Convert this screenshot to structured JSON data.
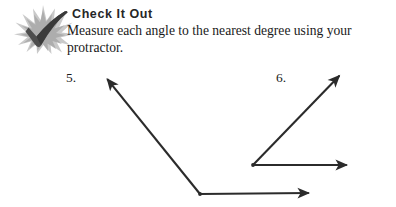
{
  "page": {
    "width": 396,
    "height": 207,
    "background": "#ffffff"
  },
  "callout": {
    "icon_name": "starburst-check-icon",
    "heading": "Check It Out",
    "body_lines": [
      "Measure each angle to the nearest degree using your",
      "protractor."
    ],
    "body_text": "Measure each angle to the nearest degree using your protractor.",
    "heading_color": "#262626",
    "body_color": "#1a1a1a",
    "burst_color": "#b5b5b5",
    "check_color": "#4a4a4a"
  },
  "problems": [
    {
      "label": "5.",
      "label_x": 66,
      "label_y": 70,
      "vertex": {
        "x": 200,
        "y": 194
      },
      "stroke": "#2b2b2b",
      "stroke_width": 2.1,
      "rays": [
        {
          "name": "upper-left-ray",
          "from": {
            "x": 200,
            "y": 194
          },
          "to": {
            "x": 104,
            "y": 75
          },
          "arrow": true
        },
        {
          "name": "horizontal-right-ray",
          "from": {
            "x": 200,
            "y": 194
          },
          "to": {
            "x": 314,
            "y": 193
          },
          "arrow": true
        }
      ]
    },
    {
      "label": "6.",
      "label_x": 276,
      "label_y": 70,
      "vertex": {
        "x": 253,
        "y": 165
      },
      "stroke": "#2b2b2b",
      "stroke_width": 2.1,
      "rays": [
        {
          "name": "upper-right-ray",
          "from": {
            "x": 253,
            "y": 165
          },
          "to": {
            "x": 343,
            "y": 72
          },
          "arrow": true
        },
        {
          "name": "horizontal-right-ray",
          "from": {
            "x": 253,
            "y": 165
          },
          "to": {
            "x": 352,
            "y": 165
          },
          "arrow": true
        }
      ]
    }
  ]
}
